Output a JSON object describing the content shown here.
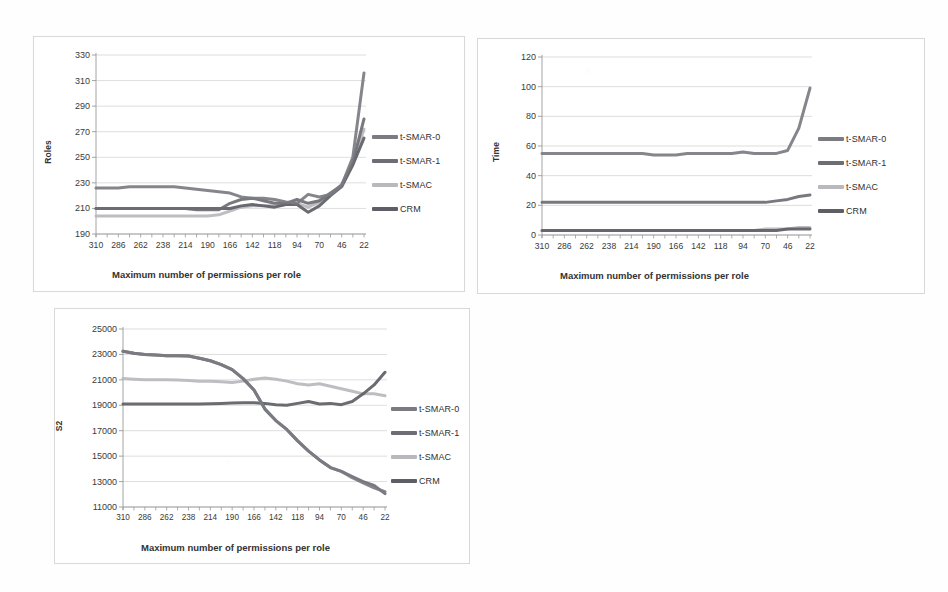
{
  "figure": {
    "background_color": "#fefefe",
    "panel_border_color": "#d8d8d8",
    "x_axis_title": "Maximum number of permissions per role",
    "x_categories": [
      "310",
      "286",
      "262",
      "238",
      "214",
      "190",
      "166",
      "142",
      "118",
      "94",
      "70",
      "46",
      "22"
    ]
  },
  "series_styles": {
    "t_smar_0": {
      "name": "t-SMAR-0",
      "color": "#7b7b82"
    },
    "t_smar_1": {
      "name": "t-SMAR-1",
      "color": "#6d6d73"
    },
    "t_smac": {
      "name": "t-SMAC",
      "color": "#b9b9bd"
    },
    "crm": {
      "name": "CRM",
      "color": "#5e5e66"
    }
  },
  "legend": {
    "items": [
      {
        "label": "t-SMAR-0",
        "color": "#7b7b82"
      },
      {
        "label": "t-SMAR-1",
        "color": "#6d6d73"
      },
      {
        "label": "t-SMAC",
        "color": "#b9b9bd"
      },
      {
        "label": "CRM",
        "color": "#5e5e66"
      }
    ]
  },
  "chart_data": [
    {
      "id": "roles",
      "type": "line",
      "title": "",
      "xlabel": "Maximum number of permissions per role",
      "ylabel": "Roles",
      "ylim": [
        190,
        330
      ],
      "yticks": [
        190,
        210,
        230,
        250,
        270,
        290,
        310,
        330
      ],
      "grid": true,
      "legend_position": "right",
      "x": [
        310,
        286,
        262,
        238,
        214,
        190,
        166,
        142,
        118,
        94,
        70,
        46,
        22
      ],
      "x_detail": [
        310,
        298,
        286,
        274,
        262,
        250,
        238,
        226,
        214,
        202,
        190,
        178,
        166,
        154,
        142,
        130,
        118,
        106,
        94,
        82,
        70,
        58,
        46,
        34,
        22
      ],
      "series": [
        {
          "name": "t-SMAR-0",
          "color": "#7b7b82",
          "values": [
            226,
            226,
            226,
            227,
            227,
            227,
            227,
            227,
            226,
            225,
            224,
            223,
            222,
            219,
            218,
            218,
            217,
            215,
            214,
            221,
            219,
            221,
            228,
            250,
            316
          ]
        },
        {
          "name": "t-SMAR-1",
          "color": "#6d6d73",
          "values": [
            210,
            210,
            210,
            210,
            210,
            210,
            210,
            210,
            210,
            209,
            209,
            209,
            214,
            217,
            218,
            216,
            214,
            214,
            217,
            214,
            216,
            222,
            228,
            246,
            280
          ]
        },
        {
          "name": "t-SMAC",
          "color": "#b9b9bd",
          "values": [
            204,
            204,
            204,
            204,
            204,
            204,
            204,
            204,
            204,
            204,
            204,
            205,
            208,
            211,
            212,
            212,
            212,
            213,
            214,
            211,
            215,
            221,
            229,
            245,
            272
          ]
        },
        {
          "name": "CRM",
          "color": "#5e5e66",
          "values": [
            210,
            210,
            210,
            210,
            210,
            210,
            210,
            210,
            210,
            210,
            210,
            210,
            210,
            212,
            213,
            212,
            211,
            213,
            213,
            207,
            212,
            220,
            227,
            244,
            265
          ]
        }
      ]
    },
    {
      "id": "time",
      "type": "line",
      "title": "",
      "xlabel": "Maximum number of permissions per role",
      "ylabel": "Time",
      "ylim": [
        0,
        120
      ],
      "yticks": [
        0,
        20,
        40,
        60,
        80,
        100,
        120
      ],
      "grid": true,
      "legend_position": "right",
      "x": [
        310,
        286,
        262,
        238,
        214,
        190,
        166,
        142,
        118,
        94,
        70,
        46,
        22
      ],
      "x_detail": [
        310,
        298,
        286,
        274,
        262,
        250,
        238,
        226,
        214,
        202,
        190,
        178,
        166,
        154,
        142,
        130,
        118,
        106,
        94,
        82,
        70,
        58,
        46,
        34,
        22
      ],
      "series": [
        {
          "name": "t-SMAR-0",
          "color": "#7b7b82",
          "values": [
            55,
            55,
            55,
            55,
            55,
            55,
            55,
            55,
            55,
            55,
            54,
            54,
            54,
            55,
            55,
            55,
            55,
            55,
            56,
            55,
            55,
            55,
            57,
            72,
            99
          ]
        },
        {
          "name": "t-SMAR-1",
          "color": "#6d6d73",
          "values": [
            22,
            22,
            22,
            22,
            22,
            22,
            22,
            22,
            22,
            22,
            22,
            22,
            22,
            22,
            22,
            22,
            22,
            22,
            22,
            22,
            22,
            23,
            24,
            26,
            27
          ]
        },
        {
          "name": "t-SMAC",
          "color": "#b9b9bd",
          "values": [
            3,
            3,
            3,
            3,
            3,
            3,
            3,
            3,
            3,
            3,
            3,
            3,
            3,
            3,
            3,
            3,
            3,
            3,
            3,
            3,
            4,
            4,
            4,
            5,
            5
          ]
        },
        {
          "name": "CRM",
          "color": "#5e5e66",
          "values": [
            3,
            3,
            3,
            3,
            3,
            3,
            3,
            3,
            3,
            3,
            3,
            3,
            3,
            3,
            3,
            3,
            3,
            3,
            3,
            3,
            3,
            3,
            4,
            4,
            4
          ]
        }
      ]
    },
    {
      "id": "s2",
      "type": "line",
      "title": "",
      "xlabel": "Maximum number of permissions per role",
      "ylabel": "S2",
      "ylim": [
        11000,
        25000
      ],
      "yticks": [
        11000,
        13000,
        15000,
        17000,
        19000,
        21000,
        23000,
        25000
      ],
      "grid": true,
      "legend_position": "right",
      "x": [
        310,
        286,
        262,
        238,
        214,
        190,
        166,
        142,
        118,
        94,
        70,
        46,
        22
      ],
      "x_detail": [
        310,
        298,
        286,
        274,
        262,
        250,
        238,
        226,
        214,
        202,
        190,
        178,
        166,
        154,
        142,
        130,
        118,
        106,
        94,
        82,
        70,
        58,
        46,
        34,
        22
      ],
      "series": [
        {
          "name": "t-SMAR-0",
          "color": "#7b7b82",
          "values": [
            23250,
            23100,
            23000,
            22950,
            22900,
            22900,
            22880,
            22700,
            22500,
            22200,
            21800,
            21100,
            20200,
            18700,
            17800,
            17100,
            16200,
            15400,
            14700,
            14100,
            13800,
            13300,
            12900,
            12500,
            12200
          ]
        },
        {
          "name": "t-SMAR-1",
          "color": "#6d6d73",
          "values": [
            23250,
            23100,
            23000,
            22950,
            22900,
            22900,
            22880,
            22700,
            22500,
            22200,
            21800,
            21100,
            20200,
            18700,
            17800,
            17100,
            16200,
            15400,
            14700,
            14100,
            13800,
            13400,
            13000,
            12700,
            12050
          ]
        },
        {
          "name": "t-SMAC",
          "color": "#b9b9bd",
          "values": [
            21100,
            21050,
            21000,
            21000,
            21000,
            20980,
            20950,
            20900,
            20900,
            20850,
            20800,
            20900,
            21050,
            21150,
            21050,
            20900,
            20700,
            20600,
            20700,
            20500,
            20300,
            20100,
            19900,
            19900,
            19750
          ]
        },
        {
          "name": "CRM",
          "color": "#5e5e66",
          "values": [
            19100,
            19100,
            19100,
            19100,
            19100,
            19100,
            19100,
            19100,
            19120,
            19150,
            19180,
            19200,
            19200,
            19150,
            19050,
            19000,
            19150,
            19300,
            19100,
            19150,
            19050,
            19300,
            19900,
            20600,
            21600
          ]
        }
      ]
    }
  ]
}
